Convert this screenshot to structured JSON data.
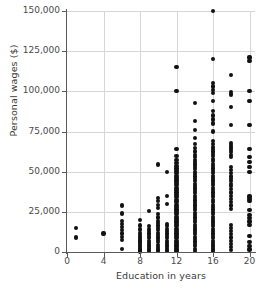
{
  "chart_data": {
    "type": "scatter",
    "title": "",
    "xlabel": "Education in years",
    "ylabel": "Personal wages ($)",
    "xlim": [
      0,
      20.6
    ],
    "ylim": [
      0,
      150000
    ],
    "xticks": [
      0,
      4,
      8,
      12,
      16,
      20
    ],
    "xticklabels": [
      "0",
      "4",
      "8",
      "12",
      "16",
      "20"
    ],
    "yticks": [
      0,
      25000,
      50000,
      75000,
      100000,
      125000,
      150000
    ],
    "yticklabels": [
      "0",
      "25,000",
      "50,000",
      "75,000",
      "100,000",
      "125,000",
      "150,000"
    ],
    "grid": true,
    "legend": false,
    "marker_color": "#111111",
    "grid_color": "#d6d6d6",
    "axis_color": "#5a5a5a",
    "points": [
      [
        1,
        15000
      ],
      [
        1,
        9000
      ],
      [
        4,
        11500
      ],
      [
        6,
        29000
      ],
      [
        6,
        24000
      ],
      [
        6,
        19500
      ],
      [
        6,
        17500
      ],
      [
        6,
        15500
      ],
      [
        6,
        13500
      ],
      [
        6,
        11500
      ],
      [
        6,
        9500
      ],
      [
        6,
        7500
      ],
      [
        6,
        2000
      ],
      [
        8,
        20000
      ],
      [
        8,
        16500
      ],
      [
        8,
        14000
      ],
      [
        8,
        12000
      ],
      [
        8,
        10500
      ],
      [
        8,
        9000
      ],
      [
        8,
        7500
      ],
      [
        8,
        6500
      ],
      [
        8,
        5500
      ],
      [
        8,
        4500
      ],
      [
        8,
        3500
      ],
      [
        8,
        2500
      ],
      [
        8,
        1500
      ],
      [
        8,
        800
      ],
      [
        8,
        300
      ],
      [
        9,
        25500
      ],
      [
        9,
        16000
      ],
      [
        9,
        14500
      ],
      [
        9,
        13000
      ],
      [
        9,
        11500
      ],
      [
        9,
        10000
      ],
      [
        9,
        8500
      ],
      [
        9,
        7000
      ],
      [
        9,
        5500
      ],
      [
        9,
        4000
      ],
      [
        9,
        2500
      ],
      [
        9,
        1200
      ],
      [
        9,
        400
      ],
      [
        10,
        54500
      ],
      [
        10,
        33500
      ],
      [
        10,
        31500
      ],
      [
        10,
        29500
      ],
      [
        10,
        27500
      ],
      [
        10,
        23500
      ],
      [
        10,
        21500
      ],
      [
        10,
        19500
      ],
      [
        10,
        18000
      ],
      [
        10,
        16500
      ],
      [
        10,
        15000
      ],
      [
        10,
        13500
      ],
      [
        10,
        12000
      ],
      [
        10,
        10500
      ],
      [
        10,
        9000
      ],
      [
        10,
        7500
      ],
      [
        10,
        6000
      ],
      [
        10,
        4500
      ],
      [
        10,
        3000
      ],
      [
        10,
        1500
      ],
      [
        10,
        500
      ],
      [
        11,
        50000
      ],
      [
        11,
        35000
      ],
      [
        11,
        30000
      ],
      [
        11,
        17500
      ],
      [
        11,
        16000
      ],
      [
        11,
        14500
      ],
      [
        11,
        13000
      ],
      [
        11,
        11500
      ],
      [
        11,
        10000
      ],
      [
        11,
        8500
      ],
      [
        11,
        7000
      ],
      [
        11,
        5500
      ],
      [
        11,
        4000
      ],
      [
        11,
        2500
      ],
      [
        11,
        1200
      ],
      [
        11,
        400
      ],
      [
        12,
        115000
      ],
      [
        12,
        100000
      ],
      [
        12,
        64000
      ],
      [
        12,
        60000
      ],
      [
        12,
        57500
      ],
      [
        12,
        55500
      ],
      [
        12,
        53500
      ],
      [
        12,
        52000
      ],
      [
        12,
        50500
      ],
      [
        12,
        49000
      ],
      [
        12,
        47500
      ],
      [
        12,
        46000
      ],
      [
        12,
        44500
      ],
      [
        12,
        43000
      ],
      [
        12,
        41500
      ],
      [
        12,
        40000
      ],
      [
        12,
        38500
      ],
      [
        12,
        37000
      ],
      [
        12,
        35500
      ],
      [
        12,
        34000
      ],
      [
        12,
        32500
      ],
      [
        12,
        31000
      ],
      [
        12,
        29500
      ],
      [
        12,
        28000
      ],
      [
        12,
        26500
      ],
      [
        12,
        25000
      ],
      [
        12,
        23500
      ],
      [
        12,
        22000
      ],
      [
        12,
        20500
      ],
      [
        12,
        19000
      ],
      [
        12,
        17500
      ],
      [
        12,
        16000
      ],
      [
        12,
        14500
      ],
      [
        12,
        13000
      ],
      [
        12,
        11500
      ],
      [
        12,
        10000
      ],
      [
        12,
        8500
      ],
      [
        12,
        7000
      ],
      [
        12,
        5500
      ],
      [
        12,
        4000
      ],
      [
        12,
        2500
      ],
      [
        12,
        1200
      ],
      [
        12,
        400
      ],
      [
        14,
        92500
      ],
      [
        14,
        81500
      ],
      [
        14,
        76000
      ],
      [
        14,
        71000
      ],
      [
        14,
        67000
      ],
      [
        14,
        64500
      ],
      [
        14,
        62500
      ],
      [
        14,
        60500
      ],
      [
        14,
        59000
      ],
      [
        14,
        57500
      ],
      [
        14,
        56000
      ],
      [
        14,
        54500
      ],
      [
        14,
        53000
      ],
      [
        14,
        51500
      ],
      [
        14,
        50000
      ],
      [
        14,
        48500
      ],
      [
        14,
        47000
      ],
      [
        14,
        45500
      ],
      [
        14,
        44000
      ],
      [
        14,
        42500
      ],
      [
        14,
        41000
      ],
      [
        14,
        39500
      ],
      [
        14,
        38000
      ],
      [
        14,
        36500
      ],
      [
        14,
        35000
      ],
      [
        14,
        33500
      ],
      [
        14,
        32000
      ],
      [
        14,
        30500
      ],
      [
        14,
        29000
      ],
      [
        14,
        27500
      ],
      [
        14,
        26000
      ],
      [
        14,
        24500
      ],
      [
        14,
        23000
      ],
      [
        14,
        21500
      ],
      [
        14,
        20000
      ],
      [
        14,
        18500
      ],
      [
        14,
        17000
      ],
      [
        14,
        15500
      ],
      [
        14,
        14000
      ],
      [
        14,
        12500
      ],
      [
        14,
        11000
      ],
      [
        14,
        9500
      ],
      [
        14,
        8000
      ],
      [
        14,
        6500
      ],
      [
        14,
        5000
      ],
      [
        14,
        3500
      ],
      [
        14,
        2000
      ],
      [
        14,
        800
      ],
      [
        16,
        150000
      ],
      [
        16,
        120000
      ],
      [
        16,
        105000
      ],
      [
        16,
        103000
      ],
      [
        16,
        101000
      ],
      [
        16,
        99000
      ],
      [
        16,
        94000
      ],
      [
        16,
        88000
      ],
      [
        16,
        85000
      ],
      [
        16,
        82500
      ],
      [
        16,
        80000
      ],
      [
        16,
        75000
      ],
      [
        16,
        69000
      ],
      [
        16,
        67000
      ],
      [
        16,
        65500
      ],
      [
        16,
        64000
      ],
      [
        16,
        62500
      ],
      [
        16,
        61000
      ],
      [
        16,
        59500
      ],
      [
        16,
        58000
      ],
      [
        16,
        56500
      ],
      [
        16,
        55000
      ],
      [
        16,
        53500
      ],
      [
        16,
        52000
      ],
      [
        16,
        50500
      ],
      [
        16,
        49000
      ],
      [
        16,
        47500
      ],
      [
        16,
        46000
      ],
      [
        16,
        44500
      ],
      [
        16,
        43000
      ],
      [
        16,
        41500
      ],
      [
        16,
        40000
      ],
      [
        16,
        38500
      ],
      [
        16,
        37000
      ],
      [
        16,
        35500
      ],
      [
        16,
        34000
      ],
      [
        16,
        32500
      ],
      [
        16,
        31000
      ],
      [
        16,
        29500
      ],
      [
        16,
        28000
      ],
      [
        16,
        26500
      ],
      [
        16,
        25000
      ],
      [
        16,
        23500
      ],
      [
        16,
        22000
      ],
      [
        16,
        20500
      ],
      [
        16,
        19000
      ],
      [
        16,
        17500
      ],
      [
        16,
        16000
      ],
      [
        16,
        14500
      ],
      [
        16,
        13000
      ],
      [
        16,
        11500
      ],
      [
        16,
        10000
      ],
      [
        16,
        8500
      ],
      [
        16,
        7000
      ],
      [
        16,
        5500
      ],
      [
        16,
        4000
      ],
      [
        16,
        2500
      ],
      [
        16,
        1200
      ],
      [
        16,
        400
      ],
      [
        18,
        110000
      ],
      [
        18,
        99500
      ],
      [
        18,
        98000
      ],
      [
        18,
        90000
      ],
      [
        18,
        79000
      ],
      [
        18,
        68000
      ],
      [
        18,
        66500
      ],
      [
        18,
        65000
      ],
      [
        18,
        63500
      ],
      [
        18,
        62000
      ],
      [
        18,
        60500
      ],
      [
        18,
        59000
      ],
      [
        18,
        53000
      ],
      [
        18,
        51000
      ],
      [
        18,
        49000
      ],
      [
        18,
        47000
      ],
      [
        18,
        45500
      ],
      [
        18,
        44000
      ],
      [
        18,
        42500
      ],
      [
        18,
        41000
      ],
      [
        18,
        39000
      ],
      [
        18,
        37000
      ],
      [
        18,
        35000
      ],
      [
        18,
        33000
      ],
      [
        18,
        31000
      ],
      [
        18,
        29000
      ],
      [
        18,
        27000
      ],
      [
        18,
        17000
      ],
      [
        18,
        15000
      ],
      [
        18,
        13000
      ],
      [
        18,
        11000
      ],
      [
        18,
        9000
      ],
      [
        18,
        7000
      ],
      [
        18,
        5000
      ],
      [
        18,
        3000
      ],
      [
        18,
        1200
      ],
      [
        20,
        121000
      ],
      [
        20,
        119000
      ],
      [
        20,
        100000
      ],
      [
        20,
        94000
      ],
      [
        20,
        79000
      ],
      [
        20,
        64000
      ],
      [
        20,
        59000
      ],
      [
        20,
        56000
      ],
      [
        20,
        53000
      ],
      [
        20,
        50000
      ],
      [
        20,
        34500
      ],
      [
        20,
        33000
      ],
      [
        20,
        31500
      ],
      [
        20,
        26000
      ],
      [
        20,
        23000
      ],
      [
        20,
        21000
      ],
      [
        20,
        19000
      ],
      [
        20,
        17000
      ],
      [
        20,
        10000
      ],
      [
        20,
        6000
      ],
      [
        20,
        3500
      ],
      [
        20,
        1500
      ]
    ]
  }
}
